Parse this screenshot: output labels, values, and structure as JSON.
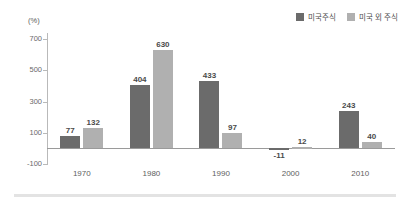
{
  "chart_data": {
    "type": "bar",
    "title": "",
    "subtitle": "",
    "xlabel": "",
    "ylabel": "(%)",
    "unit_label": "(%)",
    "categories": [
      "1970",
      "1980",
      "1990",
      "2000",
      "2010"
    ],
    "series": [
      {
        "name": "미국주식",
        "color": "#6b6b6b",
        "values": [
          77,
          404,
          433,
          -11,
          243
        ],
        "labels": [
          "77",
          "404",
          "433",
          "-11",
          "243"
        ]
      },
      {
        "name": "미국 외 주식",
        "color": "#b0b0b0",
        "values": [
          132,
          630,
          97,
          12,
          40
        ],
        "labels": [
          "132",
          "630",
          "97",
          "12",
          "40"
        ]
      }
    ],
    "ylim": [
      -100,
      740
    ],
    "yticks": [
      700,
      500,
      300,
      100,
      -100
    ],
    "ytick_labels": [
      "700",
      "500",
      "300",
      "100",
      "-100"
    ],
    "grid": false,
    "legend_position": "top-right",
    "background_color": "#ffffff",
    "axis_color": "#b9b9b9",
    "zero_line_color": "#9a9a9a"
  },
  "legend": {
    "items": [
      {
        "label": "미국주식",
        "color": "#6b6b6b"
      },
      {
        "label": "미국 외 주식",
        "color": "#b0b0b0"
      }
    ]
  }
}
